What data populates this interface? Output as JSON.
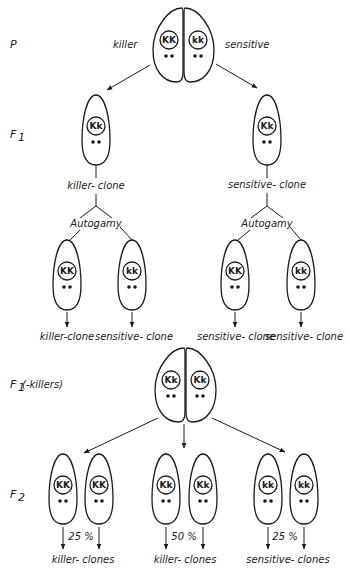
{
  "colors": {
    "ink": "#1a1a1a",
    "background": "#ffffff"
  },
  "generations": {
    "p": "P",
    "f1": "F",
    "f1_sub": "1",
    "f1_killers": "F",
    "f1_killers_sub": "1",
    "f1_killers_suffix": " (-killers)",
    "f2": "F",
    "f2_sub": "2"
  },
  "parental": {
    "left_label": "killer",
    "right_label": "sensitive",
    "left_genotype": "KK",
    "right_genotype": "kk"
  },
  "f1": {
    "left_genotype": "Kk",
    "right_genotype": "Kk",
    "left_clone_label": "killer- clone",
    "right_clone_label": "sensitive- clone",
    "left_process": "Autogamy",
    "right_process": "Autogamy"
  },
  "autogamy_progeny": [
    {
      "genotype": "KK",
      "stippled": true,
      "label": "killer-clone"
    },
    {
      "genotype": "kk",
      "stippled": true,
      "label": "sensitive- clone"
    },
    {
      "genotype": "KK",
      "stippled": false,
      "label": "sensitive- clone"
    },
    {
      "genotype": "kk",
      "stippled": false,
      "label": "sensitive- clone"
    }
  ],
  "f1_killer_pair": {
    "left_genotype": "Kk",
    "right_genotype": "Kk"
  },
  "f2_groups": [
    {
      "genotypes": [
        "KK",
        "KK"
      ],
      "percent": "25 %",
      "label": "killer- clones"
    },
    {
      "genotypes": [
        "Kk",
        "Kk"
      ],
      "percent": "50 %",
      "label": "killer- clones"
    },
    {
      "genotypes": [
        "kk",
        "kk"
      ],
      "percent": "25 %",
      "label": "sensitive- clones"
    }
  ]
}
